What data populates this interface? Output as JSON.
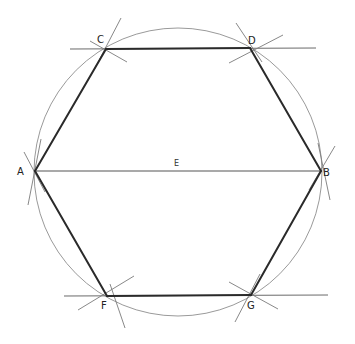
{
  "diagram": {
    "colors": {
      "hexagon_edge": "#2a2a2a",
      "diameter": "#555555",
      "circle": "#9a9a9a",
      "construction": "#7a7a7a",
      "label": "#222222",
      "background": "#ffffff"
    },
    "points": [
      {
        "id": "A",
        "label": "A"
      },
      {
        "id": "B",
        "label": "B"
      },
      {
        "id": "C",
        "label": "C"
      },
      {
        "id": "D",
        "label": "D"
      },
      {
        "id": "E",
        "label": "E"
      },
      {
        "id": "F",
        "label": "F"
      },
      {
        "id": "G",
        "label": "G"
      }
    ],
    "hexagon_order": [
      "A",
      "C",
      "D",
      "B",
      "G",
      "F"
    ],
    "diameter": [
      "A",
      "B"
    ],
    "center": "E",
    "extended_lines": [
      [
        "C",
        "D"
      ],
      [
        "F",
        "G"
      ]
    ]
  }
}
